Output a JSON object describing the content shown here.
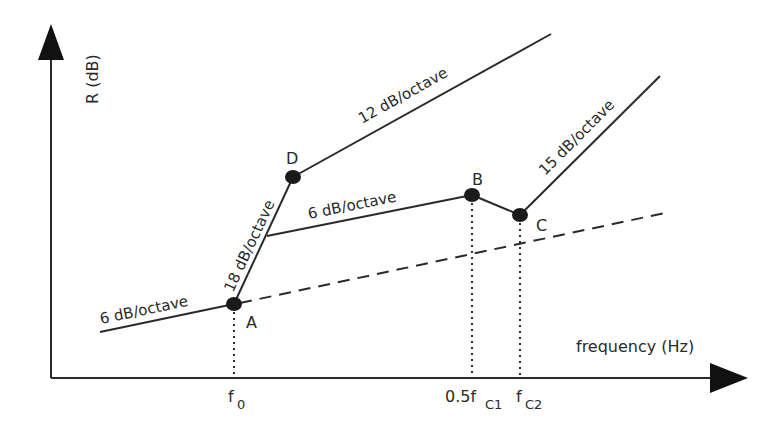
{
  "axes": {
    "y_label": "R (dB)",
    "x_label": "frequency (Hz)",
    "x_ticks": [
      {
        "label": "f",
        "sub": "0",
        "x": 234
      },
      {
        "label": "0.5f",
        "sub": "C1",
        "x": 472
      },
      {
        "label": "f",
        "sub": "C2",
        "x": 520
      }
    ]
  },
  "points": [
    {
      "name": "A",
      "x": 234,
      "y": 304
    },
    {
      "name": "D",
      "x": 293,
      "y": 177
    },
    {
      "name": "B",
      "x": 472,
      "y": 195
    },
    {
      "name": "C",
      "x": 520,
      "y": 215
    }
  ],
  "segments": [
    {
      "label": "6 dB/octave",
      "from": [
        100,
        332
      ],
      "to": [
        234,
        304
      ],
      "style": "solid"
    },
    {
      "label": "18 dB/octave",
      "from": [
        234,
        304
      ],
      "to": [
        293,
        177
      ],
      "style": "solid"
    },
    {
      "label": "12 dB/octave",
      "from": [
        293,
        177
      ],
      "to": [
        551,
        34
      ],
      "style": "solid"
    },
    {
      "label": "6 dB/octave",
      "from": [
        267,
        236
      ],
      "to": [
        472,
        195
      ],
      "style": "solid"
    },
    {
      "label": "",
      "from": [
        472,
        195
      ],
      "to": [
        520,
        215
      ],
      "style": "solid"
    },
    {
      "label": "15 dB/octave",
      "from": [
        520,
        215
      ],
      "to": [
        660,
        76
      ],
      "style": "solid"
    },
    {
      "label": "",
      "from": [
        234,
        304
      ],
      "to": [
        665,
        213
      ],
      "style": "dashed"
    }
  ],
  "labels": {
    "seg_low": "6 dB/octave",
    "seg_steep": "18 dB/octave",
    "seg_upper": "12 dB/octave",
    "seg_mid": "6 dB/octave",
    "seg_right": "15 dB/octave",
    "point_a": "A",
    "point_b": "B",
    "point_c": "C",
    "point_d": "D",
    "tick_f0_main": "f",
    "tick_f0_sub": "0",
    "tick_fc1_main": "0.5f",
    "tick_fc1_sub": "C1",
    "tick_fc2_main": "f",
    "tick_fc2_sub": "C2",
    "y_axis": "R (dB)",
    "x_axis": "frequency (Hz)"
  },
  "colors": {
    "line": "#2a2a2a",
    "point": "#1a1a1a",
    "background": "#ffffff"
  }
}
